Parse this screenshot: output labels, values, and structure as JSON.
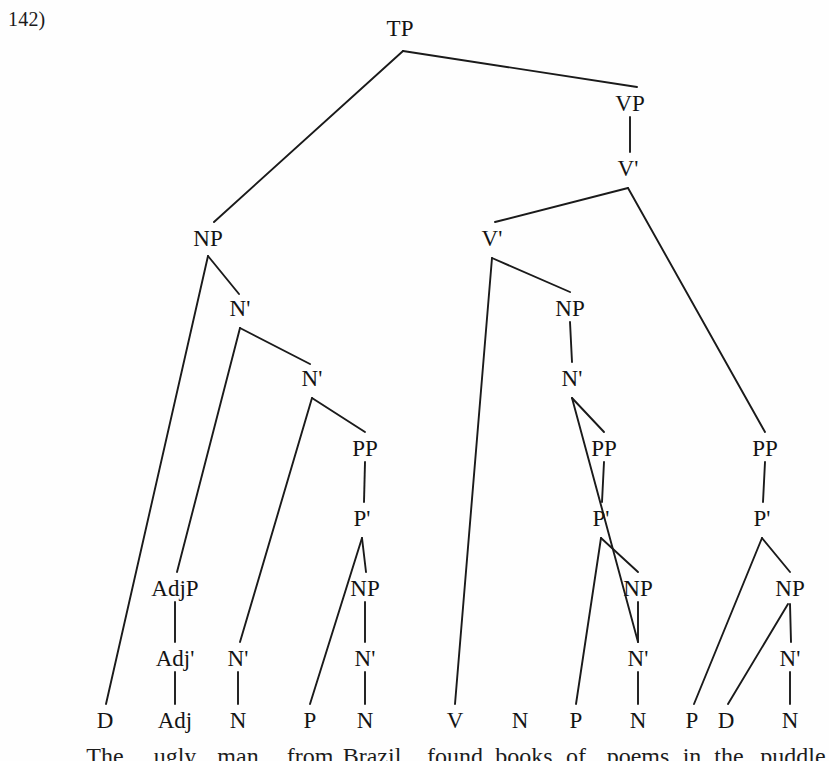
{
  "example_number": "142)",
  "diagram": {
    "type": "syntax-tree",
    "line_color": "#1a1a1a",
    "text_color": "#141414",
    "background": "#fefefe",
    "nodes": [
      {
        "id": "TP",
        "label": "TP",
        "x": 400,
        "y": 28
      },
      {
        "id": "VP",
        "label": "VP",
        "x": 630,
        "y": 103
      },
      {
        "id": "Vbar1",
        "label": "V'",
        "x": 628,
        "y": 168
      },
      {
        "id": "NP1",
        "label": "NP",
        "x": 208,
        "y": 238
      },
      {
        "id": "Vbar2",
        "label": "V'",
        "x": 492,
        "y": 238
      },
      {
        "id": "Nbar1",
        "label": "N'",
        "x": 240,
        "y": 308
      },
      {
        "id": "NP2",
        "label": "NP",
        "x": 570,
        "y": 308
      },
      {
        "id": "Nbar2",
        "label": "N'",
        "x": 312,
        "y": 378
      },
      {
        "id": "Nbar3",
        "label": "N'",
        "x": 572,
        "y": 378
      },
      {
        "id": "PP1",
        "label": "PP",
        "x": 365,
        "y": 448
      },
      {
        "id": "PP2",
        "label": "PP",
        "x": 604,
        "y": 448
      },
      {
        "id": "PP3",
        "label": "PP",
        "x": 765,
        "y": 448
      },
      {
        "id": "Pbar1",
        "label": "P'",
        "x": 362,
        "y": 518
      },
      {
        "id": "Pbar2",
        "label": "P'",
        "x": 601,
        "y": 518
      },
      {
        "id": "Pbar3",
        "label": "P'",
        "x": 762,
        "y": 518
      },
      {
        "id": "AdjP",
        "label": "AdjP",
        "x": 175,
        "y": 588
      },
      {
        "id": "NP3",
        "label": "NP",
        "x": 365,
        "y": 588
      },
      {
        "id": "NP4",
        "label": "NP",
        "x": 638,
        "y": 588
      },
      {
        "id": "NP5",
        "label": "NP",
        "x": 790,
        "y": 588
      },
      {
        "id": "Adjbar",
        "label": "Adj'",
        "x": 175,
        "y": 658
      },
      {
        "id": "Nbar4",
        "label": "N'",
        "x": 238,
        "y": 658
      },
      {
        "id": "Nbar5",
        "label": "N'",
        "x": 365,
        "y": 658
      },
      {
        "id": "Nbar6",
        "label": "N'",
        "x": 638,
        "y": 658
      },
      {
        "id": "Nbar7",
        "label": "N'",
        "x": 790,
        "y": 658
      }
    ],
    "leaves": [
      {
        "id": "L_D1",
        "label": "D",
        "x": 105,
        "y": 720
      },
      {
        "id": "L_Adj",
        "label": "Adj",
        "x": 175,
        "y": 720
      },
      {
        "id": "L_N1",
        "label": "N",
        "x": 238,
        "y": 720
      },
      {
        "id": "L_P1",
        "label": "P",
        "x": 310,
        "y": 720
      },
      {
        "id": "L_N2",
        "label": "N",
        "x": 365,
        "y": 720
      },
      {
        "id": "L_V",
        "label": "V",
        "x": 455,
        "y": 720
      },
      {
        "id": "L_N3",
        "label": "N",
        "x": 520,
        "y": 720
      },
      {
        "id": "L_P2",
        "label": "P",
        "x": 576,
        "y": 720
      },
      {
        "id": "L_N4",
        "label": "N",
        "x": 638,
        "y": 720
      },
      {
        "id": "L_P3",
        "label": "P",
        "x": 692,
        "y": 720
      },
      {
        "id": "L_D2",
        "label": "D",
        "x": 726,
        "y": 720
      },
      {
        "id": "L_N5",
        "label": "N",
        "x": 790,
        "y": 720
      }
    ],
    "edges": [
      {
        "from": "TP",
        "to": "NP1",
        "x1": 403,
        "y1": 51,
        "x2": 214,
        "y2": 222
      },
      {
        "from": "TP",
        "to": "VP",
        "x1": 403,
        "y1": 51,
        "x2": 637,
        "y2": 87
      },
      {
        "from": "VP",
        "to": "Vbar1",
        "x1": 630,
        "y1": 117,
        "x2": 630,
        "y2": 152
      },
      {
        "from": "Vbar1",
        "to": "Vbar2",
        "x1": 628,
        "y1": 188,
        "x2": 495,
        "y2": 222
      },
      {
        "from": "Vbar1",
        "to": "PP3",
        "x1": 628,
        "y1": 188,
        "x2": 765,
        "y2": 432
      },
      {
        "from": "NP1",
        "to": "L_D1",
        "x1": 208,
        "y1": 256,
        "x2": 106,
        "y2": 704
      },
      {
        "from": "NP1",
        "to": "Nbar1",
        "x1": 208,
        "y1": 256,
        "x2": 239,
        "y2": 294
      },
      {
        "from": "Vbar2",
        "to": "L_V",
        "x1": 492,
        "y1": 258,
        "x2": 455,
        "y2": 704
      },
      {
        "from": "Vbar2",
        "to": "NP2",
        "x1": 492,
        "y1": 258,
        "x2": 570,
        "y2": 292
      },
      {
        "from": "Nbar1",
        "to": "L_Adj_path",
        "x1": 240,
        "y1": 328,
        "x2": 177,
        "y2": 572
      },
      {
        "from": "Nbar1",
        "to": "Nbar2",
        "x1": 240,
        "y1": 328,
        "x2": 310,
        "y2": 364
      },
      {
        "from": "NP2",
        "to": "Nbar3",
        "x1": 570,
        "y1": 322,
        "x2": 572,
        "y2": 362
      },
      {
        "from": "Nbar2",
        "to": "Nbar4",
        "x1": 312,
        "y1": 398,
        "x2": 240,
        "y2": 642
      },
      {
        "from": "Nbar2",
        "to": "PP1",
        "x1": 312,
        "y1": 398,
        "x2": 365,
        "y2": 432
      },
      {
        "from": "Nbar3",
        "to": "Nbar6",
        "x1": 572,
        "y1": 398,
        "x2": 638,
        "y2": 642
      },
      {
        "from": "Nbar3",
        "to": "PP2",
        "x1": 572,
        "y1": 398,
        "x2": 604,
        "y2": 432
      },
      {
        "from": "PP1",
        "to": "Pbar1",
        "x1": 365,
        "y1": 462,
        "x2": 364,
        "y2": 502
      },
      {
        "from": "PP2",
        "to": "Pbar2",
        "x1": 604,
        "y1": 462,
        "x2": 602,
        "y2": 502
      },
      {
        "from": "PP3",
        "to": "Pbar3",
        "x1": 765,
        "y1": 462,
        "x2": 763,
        "y2": 502
      },
      {
        "from": "Pbar1",
        "to": "L_P1",
        "x1": 362,
        "y1": 538,
        "x2": 310,
        "y2": 704
      },
      {
        "from": "Pbar1",
        "to": "NP3",
        "x1": 362,
        "y1": 538,
        "x2": 366,
        "y2": 572
      },
      {
        "from": "Pbar2",
        "to": "L_P2",
        "x1": 601,
        "y1": 538,
        "x2": 576,
        "y2": 704
      },
      {
        "from": "Pbar2",
        "to": "NP4",
        "x1": 601,
        "y1": 538,
        "x2": 638,
        "y2": 572
      },
      {
        "from": "Pbar3",
        "to": "L_P3",
        "x1": 762,
        "y1": 538,
        "x2": 694,
        "y2": 704
      },
      {
        "from": "Pbar3",
        "to": "NP5",
        "x1": 762,
        "y1": 538,
        "x2": 790,
        "y2": 572
      },
      {
        "from": "AdjP",
        "to": "Adjbar",
        "x1": 175,
        "y1": 602,
        "x2": 175,
        "y2": 642
      },
      {
        "from": "NP3",
        "to": "Nbar5",
        "x1": 365,
        "y1": 602,
        "x2": 365,
        "y2": 642
      },
      {
        "from": "NP4",
        "to": "Nbar6",
        "x1": 638,
        "y1": 602,
        "x2": 638,
        "y2": 642
      },
      {
        "from": "NP5",
        "to": "L_D2",
        "x1": 788,
        "y1": 604,
        "x2": 728,
        "y2": 704
      },
      {
        "from": "NP5",
        "to": "Nbar7",
        "x1": 790,
        "y1": 604,
        "x2": 791,
        "y2": 642
      },
      {
        "from": "Adjbar",
        "to": "L_Adj",
        "x1": 175,
        "y1": 672,
        "x2": 175,
        "y2": 704
      },
      {
        "from": "Nbar4",
        "to": "L_N1",
        "x1": 238,
        "y1": 672,
        "x2": 238,
        "y2": 704
      },
      {
        "from": "Nbar5",
        "to": "L_N2",
        "x1": 365,
        "y1": 672,
        "x2": 365,
        "y2": 704
      },
      {
        "from": "Nbar6",
        "to": "L_N4",
        "x1": 638,
        "y1": 672,
        "x2": 638,
        "y2": 704
      },
      {
        "from": "Nbar7",
        "to": "L_N5",
        "x1": 790,
        "y1": 672,
        "x2": 790,
        "y2": 704
      }
    ]
  },
  "sentence": {
    "full_text": "The ugly man from Brazil found books of poems in the puddle",
    "words": [
      {
        "text": "The",
        "x": 105
      },
      {
        "text": "ugly",
        "x": 175
      },
      {
        "text": "man",
        "x": 238
      },
      {
        "text": "from",
        "x": 310
      },
      {
        "text": "Brazil",
        "x": 372
      },
      {
        "text": "found",
        "x": 455
      },
      {
        "text": "books",
        "x": 524
      },
      {
        "text": "of",
        "x": 576
      },
      {
        "text": "poems",
        "x": 638
      },
      {
        "text": "in",
        "x": 692
      },
      {
        "text": "the",
        "x": 729
      },
      {
        "text": "puddle",
        "x": 793
      }
    ]
  }
}
